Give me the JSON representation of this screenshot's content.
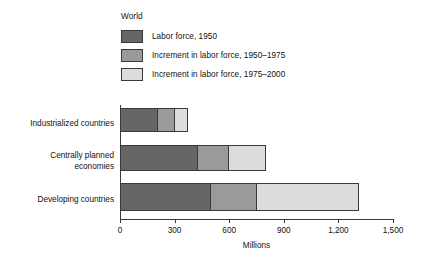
{
  "chart_data": {
    "type": "bar",
    "orientation": "horizontal",
    "stacked": true,
    "title": "World",
    "xlabel": "Millions",
    "ylabel": "",
    "xlim": [
      0,
      1500
    ],
    "xticks": [
      0,
      300,
      600,
      900,
      1200,
      1500
    ],
    "xtick_labels": [
      "0",
      "300",
      "600",
      "900",
      "1,200",
      "1,500"
    ],
    "grid": false,
    "legend_position": "top-left",
    "categories": [
      "Industrialized countries",
      "Centrally planned economies",
      "Developing countries"
    ],
    "series": [
      {
        "name": "Labor force, 1950",
        "color": "#666666",
        "values": [
          210,
          430,
          500
        ]
      },
      {
        "name": "Increment in labor force, 1950–1975",
        "color": "#9a9a9a",
        "values": [
          90,
          170,
          250
        ]
      },
      {
        "name": "Increment in labor force, 1975–2000",
        "color": "#dcdcdc",
        "values": [
          75,
          205,
          565
        ]
      }
    ],
    "totals": [
      375,
      805,
      1315
    ]
  },
  "legend": {
    "title": "World",
    "items": [
      {
        "label": "Labor force, 1950",
        "color": "#666666"
      },
      {
        "label": "Increment in labor force, 1950–1975",
        "color": "#9a9a9a"
      },
      {
        "label": "Increment in labor force, 1975–2000",
        "color": "#dcdcdc"
      }
    ]
  },
  "axis": {
    "x_title": "Millions",
    "ticks": [
      "0",
      "300",
      "600",
      "900",
      "1,200",
      "1,500"
    ]
  },
  "categories": {
    "c0": "Industrialized countries",
    "c1": "Centrally planned\neconomies",
    "c2": "Developing countries"
  },
  "colors": {
    "series1": "#666666",
    "series2": "#9a9a9a",
    "series3": "#dcdcdc",
    "outline": "#3a3a3a",
    "text": "#111111",
    "background": "#ffffff"
  }
}
